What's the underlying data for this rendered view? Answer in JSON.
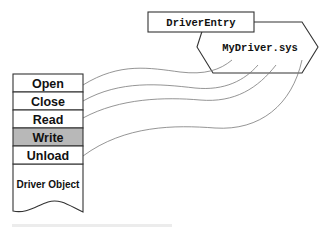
{
  "diagram": {
    "driver_entry": {
      "label": "DriverEntry"
    },
    "image_file": {
      "label": "MyDriver.sys"
    },
    "driver_object": {
      "label": "Driver Object",
      "dispatch_rows": [
        {
          "label": "Open",
          "highlighted": false,
          "linked": true
        },
        {
          "label": "Close",
          "highlighted": false,
          "linked": true
        },
        {
          "label": "Read",
          "highlighted": false,
          "linked": true
        },
        {
          "label": "Write",
          "highlighted": true,
          "linked": false
        },
        {
          "label": "Unload",
          "highlighted": false,
          "linked": true
        }
      ]
    },
    "connections": [
      {
        "from": "Open",
        "to": "MyDriver.sys"
      },
      {
        "from": "Close",
        "to": "MyDriver.sys"
      },
      {
        "from": "Read",
        "to": "MyDriver.sys"
      },
      {
        "from": "Unload",
        "to": "MyDriver.sys"
      }
    ],
    "colors": {
      "highlight_fill": "#b8b8b8",
      "outline": "#333333",
      "connector": "#7a7a7a"
    }
  }
}
